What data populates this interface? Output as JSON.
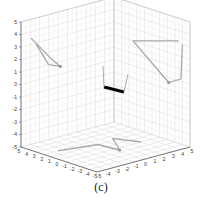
{
  "chart_data": {
    "type": "3d-line",
    "title": "",
    "caption": "(c)",
    "xlabel": "",
    "ylabel": "",
    "zlabel": "",
    "xlim": [
      -5,
      5
    ],
    "ylim": [
      -5,
      5
    ],
    "zlim": [
      -5,
      5
    ],
    "grid": true,
    "box": true,
    "x_ticks": [
      "-5",
      "-4",
      "-3",
      "-2",
      "-1",
      "0",
      "1",
      "2",
      "3",
      "4",
      "5"
    ],
    "y_ticks": [
      "5",
      "4",
      "3",
      "2",
      "1",
      "0",
      "-1",
      "-2",
      "-3",
      "-4",
      "-5"
    ],
    "z_ticks": [
      "5",
      "4",
      "3",
      "2",
      "1",
      "0",
      "-1",
      "-2",
      "-3",
      "-4",
      "-5"
    ],
    "series": [
      {
        "name": "link-3d",
        "color": "#000000",
        "linewidth": "thick",
        "description": "Short thick black segment near the center of the cube",
        "points_3d": [
          [
            0.0,
            0.0,
            0.0
          ],
          [
            1.5,
            0.0,
            -0.3
          ]
        ]
      },
      {
        "name": "projection-yz-wall",
        "color": "#a0a0a0",
        "description": "Gray linkage projection on left (y-z) wall",
        "points_2d": [
          [
            3.8,
            3.5
          ],
          [
            1.5,
            1.5
          ],
          [
            0.3,
            0.6
          ],
          [
            1.7,
            1.0
          ],
          [
            3.2,
            2.9
          ]
        ]
      },
      {
        "name": "projection-xz-wall",
        "color": "#a0a0a0",
        "description": "Gray linkage projection on right (x-z) wall",
        "points_2d": [
          [
            -4.0,
            3.0
          ],
          [
            -3.8,
            0.2
          ],
          [
            -2.2,
            -0.4
          ],
          [
            2.5,
            2.0
          ],
          [
            -3.5,
            3.2
          ]
        ]
      },
      {
        "name": "projection-xy-floor",
        "color": "#a0a0a0",
        "description": "Gray linkage projection on floor (x-y plane)",
        "points_2d": [
          [
            -3.5,
            2.0
          ],
          [
            0.0,
            1.0
          ],
          [
            0.3,
            -1.5
          ],
          [
            2.0,
            1.5
          ],
          [
            3.0,
            -1.0
          ]
        ]
      }
    ]
  }
}
